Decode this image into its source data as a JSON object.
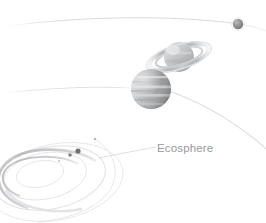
{
  "diagram": {
    "title": "Ecosphere",
    "background_color": "#ffffff",
    "labels": [
      {
        "id": "ecosphere",
        "text": "Ecosphere",
        "color": "#9a9a9c",
        "x": 157,
        "y": 142
      }
    ],
    "bodies": [
      {
        "id": "distant-planet",
        "name": "small-distant-planet",
        "type": "planet",
        "cx": 238,
        "cy": 24,
        "r": 5.2,
        "color": "#8e9092",
        "highlight": "#c3c5c7"
      },
      {
        "id": "ringed-planet",
        "name": "ringed-gas-giant",
        "type": "ringed-planet",
        "cx": 179,
        "cy": 57,
        "r": 15,
        "ring_rx": 31,
        "ring_ry": 11,
        "ring_rotation": -17,
        "color": "#b6b8ba",
        "ring_color": "#cfd1d3"
      },
      {
        "id": "banded-planet",
        "name": "banded-gas-giant",
        "type": "planet",
        "cx": 151,
        "cy": 89,
        "r": 20,
        "color": "#aeb0b2",
        "bands": 6
      },
      {
        "id": "inner-planet-a",
        "name": "inner-planet-a",
        "type": "planet",
        "cx": 78,
        "cy": 151,
        "r": 2.6,
        "color": "#6e7072"
      },
      {
        "id": "inner-planet-b",
        "name": "inner-planet-b",
        "type": "planet",
        "cx": 70,
        "cy": 155,
        "r": 1.8,
        "color": "#7e8082"
      },
      {
        "id": "inner-planet-c",
        "name": "inner-planet-c",
        "type": "planet",
        "cx": 95,
        "cy": 139,
        "r": 1.2,
        "color": "#b4b6b8"
      },
      {
        "id": "inner-planet-d",
        "name": "inner-planet-d",
        "type": "planet",
        "cx": 59,
        "cy": 161,
        "r": 1.0,
        "color": "#c0c2c4"
      }
    ],
    "orbits": [
      {
        "id": "orbit-outer-top",
        "name": "outer-orbit-arc",
        "stroke": "#d8d9db"
      },
      {
        "id": "orbit-mid",
        "name": "middle-orbit-arc",
        "stroke": "#e2e3e5"
      },
      {
        "id": "orbit-inner-sweep",
        "name": "inner-orbit-sweep",
        "stroke": "#dcdde0"
      },
      {
        "id": "ecosphere-ring-1",
        "name": "ecosphere-ring-outer",
        "stroke": "#d2d3d5"
      },
      {
        "id": "ecosphere-ring-2",
        "name": "ecosphere-ring-middle",
        "stroke": "#d8d9db"
      },
      {
        "id": "ecosphere-ring-3",
        "name": "ecosphere-ring-inner",
        "stroke": "#dfe0e2"
      },
      {
        "id": "ecosphere-ring-4",
        "name": "ecosphere-ring-core",
        "stroke": "#e4e5e7"
      },
      {
        "id": "leader-line",
        "name": "ecosphere-leader-line",
        "stroke": "#d0d1d3"
      }
    ]
  }
}
